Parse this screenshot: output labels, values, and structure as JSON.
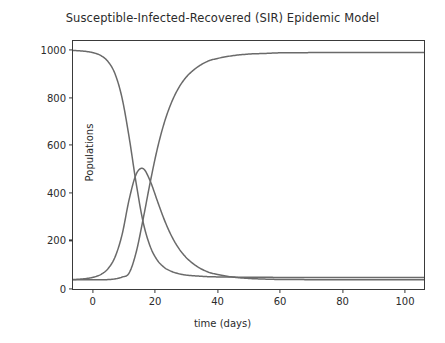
{
  "chart_data": {
    "type": "line",
    "title": "Susceptible-Infected-Recovered (SIR) Epidemic Model",
    "xlabel": "time (days)",
    "ylabel": "Populations",
    "xlim": [
      0,
      100
    ],
    "ylim": [
      -40,
      1040
    ],
    "xticks": [
      "0",
      "20",
      "40",
      "60",
      "80",
      "100"
    ],
    "yticks": [
      "0",
      "200",
      "400",
      "600",
      "800",
      "1000"
    ],
    "grid": false,
    "legend_position": "center right",
    "legend": [
      "S",
      "I",
      "R"
    ],
    "x": [
      0,
      2,
      4,
      6,
      8,
      10,
      12,
      14,
      16,
      18,
      20,
      22,
      24,
      26,
      28,
      30,
      32,
      34,
      36,
      38,
      40,
      45,
      50,
      55,
      60,
      65,
      70,
      75,
      80,
      85,
      90,
      95,
      100
    ],
    "series": [
      {
        "name": "S",
        "label": "S",
        "color": "#6a6a6a",
        "values": [
          999,
          997,
          994,
          988,
          976,
          950,
          896,
          790,
          620,
          420,
          250,
          145,
          86,
          54,
          37,
          27,
          21,
          18,
          16,
          14,
          13,
          12,
          11,
          11,
          10,
          10,
          10,
          10,
          10,
          10,
          10,
          10,
          10
        ]
      },
      {
        "name": "I",
        "label": "I",
        "color": "#6a6a6a",
        "values": [
          1,
          3,
          6,
          12,
          24,
          49,
          100,
          198,
          350,
          460,
          484,
          430,
          345,
          262,
          193,
          140,
          101,
          73,
          52,
          37,
          27,
          13,
          6,
          3,
          1,
          1,
          0,
          0,
          0,
          0,
          0,
          0,
          0
        ]
      },
      {
        "name": "R",
        "label": "R",
        "color": "#6a6a6a",
        "values": [
          0,
          0,
          0,
          0,
          0,
          1,
          4,
          12,
          30,
          120,
          266,
          425,
          569,
          684,
          770,
          833,
          878,
          909,
          932,
          949,
          960,
          975,
          983,
          986,
          989,
          989,
          990,
          990,
          990,
          990,
          990,
          990,
          990
        ]
      }
    ],
    "annotations": {
      "infected_peak_value": 484,
      "infected_peak_day": 20,
      "initial_susceptible": 1000,
      "final_recovered": 990
    }
  }
}
